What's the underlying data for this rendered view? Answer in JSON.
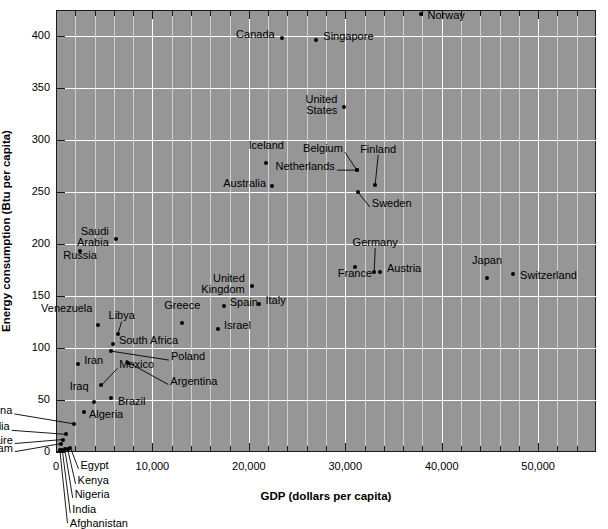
{
  "chart_data": {
    "type": "scatter",
    "title": "",
    "xlabel": "GDP (dollars per capita)",
    "ylabel": "Energy consumption (Btu per capita)",
    "xlim": [
      0,
      56000
    ],
    "ylim": [
      0,
      425
    ],
    "xticks": [
      0,
      10000,
      20000,
      30000,
      40000,
      50000
    ],
    "xticklabels": [
      "0",
      "10,000",
      "20,000",
      "30,000",
      "40,000",
      "50,000"
    ],
    "yticks": [
      0,
      50,
      100,
      150,
      200,
      250,
      300,
      350,
      400
    ],
    "yticklabels": [
      "0",
      "50",
      "100",
      "150",
      "200",
      "250",
      "300",
      "350",
      "400"
    ],
    "x_minor_step": 2000,
    "y_minor_step": 50,
    "grid": true,
    "grid_color": "#ffffff",
    "plot_bg": "#969696",
    "marker_color": "#000000",
    "legend": "none",
    "points": [
      {
        "name": "Norway",
        "x": 37800,
        "y": 421,
        "label_dx": 7,
        "label_dy": 9,
        "align": "left",
        "leader": false
      },
      {
        "name": "Canada",
        "x": 23400,
        "y": 398,
        "label_dx": -7,
        "label_dy": 4,
        "align": "right",
        "leader": false
      },
      {
        "name": "Singapore",
        "x": 27000,
        "y": 396,
        "label_dx": 7,
        "label_dy": 4,
        "align": "left",
        "leader": false
      },
      {
        "name": "United\nStates",
        "x": 29900,
        "y": 332,
        "label_dx": -7,
        "label_dy": 0,
        "align": "right",
        "leader": false
      },
      {
        "name": "Iceland",
        "x": 21800,
        "y": 278,
        "label_dx": 0,
        "label_dy": -10,
        "align": "center",
        "leader": false
      },
      {
        "name": "Belgium",
        "x": 31200,
        "y": 271,
        "label_dx": -14,
        "label_dy": -14,
        "align": "right",
        "leader": true
      },
      {
        "name": "Netherlands",
        "x": 31200,
        "y": 271,
        "label_dx": -22,
        "label_dy": 4,
        "align": "right",
        "leader": true
      },
      {
        "name": "Finland",
        "x": 33100,
        "y": 257,
        "label_dx": 3,
        "label_dy": -28,
        "align": "center",
        "leader": true
      },
      {
        "name": "Australia",
        "x": 22400,
        "y": 256,
        "label_dx": -6,
        "label_dy": 5,
        "align": "right",
        "leader": false
      },
      {
        "name": "Sweden",
        "x": 31300,
        "y": 250,
        "label_dx": 14,
        "label_dy": 19,
        "align": "left",
        "leader": true
      },
      {
        "name": "Saudi\nArabia",
        "x": 6200,
        "y": 205,
        "label_dx": -7,
        "label_dy": 0,
        "align": "right",
        "leader": false
      },
      {
        "name": "Russia",
        "x": 2500,
        "y": 193,
        "label_dx": 0,
        "label_dy": 12,
        "align": "center",
        "leader": false
      },
      {
        "name": "Germany",
        "x": 33000,
        "y": 173,
        "label_dx": 1,
        "label_dy": -22,
        "align": "center",
        "leader": true
      },
      {
        "name": "Austria",
        "x": 33600,
        "y": 173,
        "label_dx": 7,
        "label_dy": 4,
        "align": "left",
        "leader": false
      },
      {
        "name": "Switzerland",
        "x": 47400,
        "y": 171,
        "label_dx": 7,
        "label_dy": 9,
        "align": "left",
        "leader": false
      },
      {
        "name": "France",
        "x": 31000,
        "y": 178,
        "label_dx": 0,
        "label_dy": 14,
        "align": "center",
        "leader": false
      },
      {
        "name": "Japan",
        "x": 44700,
        "y": 167,
        "label_dx": 0,
        "label_dy": -10,
        "align": "center",
        "leader": false
      },
      {
        "name": "United\nKingdom",
        "x": 20300,
        "y": 160,
        "label_dx": -7,
        "label_dy": 0,
        "align": "right",
        "leader": false
      },
      {
        "name": "Spain",
        "x": 17400,
        "y": 140,
        "label_dx": 6,
        "label_dy": 4,
        "align": "left",
        "leader": false
      },
      {
        "name": "Italy",
        "x": 21100,
        "y": 142,
        "label_dx": 6,
        "label_dy": 4,
        "align": "left",
        "leader": false
      },
      {
        "name": "Israel",
        "x": 16800,
        "y": 118,
        "label_dx": 6,
        "label_dy": 4,
        "align": "left",
        "leader": false
      },
      {
        "name": "Venezuela",
        "x": 4400,
        "y": 122,
        "label_dx": -6,
        "label_dy": -9,
        "align": "right",
        "leader": false
      },
      {
        "name": "Greece",
        "x": 13100,
        "y": 124,
        "label_dx": 0,
        "label_dy": -10,
        "align": "center",
        "leader": false
      },
      {
        "name": "Libya",
        "x": 6400,
        "y": 113,
        "label_dx": 4,
        "label_dy": -11,
        "align": "center",
        "leader": true
      },
      {
        "name": "South Africa",
        "x": 5900,
        "y": 104,
        "label_dx": 6,
        "label_dy": 4,
        "align": "left",
        "leader": false
      },
      {
        "name": "Poland",
        "x": 5700,
        "y": 97,
        "label_dx": 60,
        "label_dy": 13,
        "align": "left",
        "leader": true
      },
      {
        "name": "Argentina",
        "x": 7500,
        "y": 86,
        "label_dx": 42,
        "label_dy": 26,
        "align": "left",
        "leader": true
      },
      {
        "name": "Iran",
        "x": 2300,
        "y": 85,
        "label_dx": 6,
        "label_dy": 4,
        "align": "left",
        "leader": false
      },
      {
        "name": "Mexico",
        "x": 4700,
        "y": 64,
        "label_dx": 18,
        "label_dy": -13,
        "align": "left",
        "leader": true
      },
      {
        "name": "Iraq",
        "x": 3900,
        "y": 48,
        "label_dx": -5,
        "label_dy": -8,
        "align": "right",
        "leader": false
      },
      {
        "name": "Brazil",
        "x": 5700,
        "y": 52,
        "label_dx": 7,
        "label_dy": 11,
        "align": "left",
        "leader": false
      },
      {
        "name": "Algeria",
        "x": 2900,
        "y": 38,
        "label_dx": 5,
        "label_dy": 10,
        "align": "left",
        "leader": false
      },
      {
        "name": "China",
        "x": 1900,
        "y": 27,
        "label_dx": -62,
        "label_dy": -6,
        "align": "right",
        "leader": true
      },
      {
        "name": "Somalia",
        "x": 1000,
        "y": 17,
        "label_dx": -56,
        "label_dy": 0,
        "align": "right",
        "leader": true
      },
      {
        "name": "Zaire",
        "x": 700,
        "y": 12,
        "label_dx": -50,
        "label_dy": 8,
        "align": "right",
        "leader": true
      },
      {
        "name": "Vietnam",
        "x": 500,
        "y": 8,
        "label_dx": -48,
        "label_dy": 12,
        "align": "right",
        "leader": true
      },
      {
        "name": "Egypt",
        "x": 1500,
        "y": 4,
        "label_dx": 10,
        "label_dy": 25,
        "align": "left",
        "leader": true
      },
      {
        "name": "Kenya",
        "x": 1200,
        "y": 3,
        "label_dx": 10,
        "label_dy": 39,
        "align": "left",
        "leader": true
      },
      {
        "name": "Nigeria",
        "x": 900,
        "y": 3,
        "label_dx": 10,
        "label_dy": 53,
        "align": "left",
        "leader": true
      },
      {
        "name": "India",
        "x": 650,
        "y": 2,
        "label_dx": 10,
        "label_dy": 67,
        "align": "left",
        "leader": true
      },
      {
        "name": "Afghanistan",
        "x": 400,
        "y": 2,
        "label_dx": 10,
        "label_dy": 81,
        "align": "left",
        "leader": true
      }
    ]
  }
}
